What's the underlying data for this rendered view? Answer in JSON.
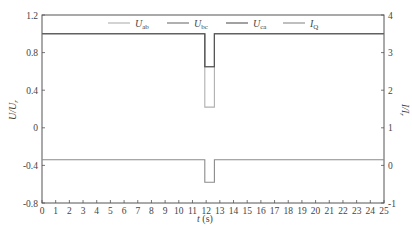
{
  "chart_data": {
    "type": "line",
    "title": "",
    "xlabel": "t (s)",
    "ylabel_left": "U/U_r",
    "ylabel_right": "I/I_r",
    "xlim": [
      0,
      25
    ],
    "ylim_left": [
      -0.8,
      1.2
    ],
    "ylim_right": [
      -1,
      4
    ],
    "grid": false,
    "legend_position": "top-inside",
    "x_ticks": [
      "0",
      "1",
      "2",
      "3",
      "4",
      "5",
      "6",
      "7",
      "8",
      "9",
      "10",
      "11",
      "12",
      "13",
      "14",
      "15",
      "16",
      "17",
      "18",
      "19",
      "20",
      "21",
      "22",
      "23",
      "24",
      "25"
    ],
    "y_ticks_left": [
      "1.2",
      "0.8",
      "0.4",
      "0",
      "-0.4",
      "-0.8"
    ],
    "y_ticks_right": [
      "4",
      "3",
      "2",
      "1",
      "0",
      "-1"
    ],
    "legend": [
      "U_ab",
      "U_bc",
      "U_ca",
      "I_Q"
    ],
    "series": [
      {
        "name": "U_ab",
        "axis": "left",
        "x": [
          0,
          11.9,
          11.9,
          12.6,
          12.6,
          25
        ],
        "values": [
          1.0,
          1.0,
          0.22,
          0.22,
          1.0,
          1.0
        ]
      },
      {
        "name": "U_bc",
        "axis": "left",
        "x": [
          0,
          11.9,
          11.9,
          12.6,
          12.6,
          25
        ],
        "values": [
          1.0,
          1.0,
          0.65,
          0.65,
          1.0,
          1.0
        ]
      },
      {
        "name": "U_ca",
        "axis": "left",
        "x": [
          0,
          11.9,
          11.9,
          12.6,
          12.6,
          25
        ],
        "values": [
          1.0,
          1.0,
          0.65,
          0.65,
          1.0,
          1.0
        ]
      },
      {
        "name": "I_Q",
        "axis": "right",
        "x": [
          0,
          11.9,
          11.9,
          12.6,
          12.6,
          25
        ],
        "values": [
          0.15,
          0.15,
          -0.45,
          -0.45,
          0.15,
          0.15
        ]
      }
    ]
  },
  "labels": {
    "xlabel_t": "t",
    "xlabel_unit": " (s)",
    "ylabel_left_main": "U/U",
    "ylabel_left_sub": "r",
    "ylabel_right_main": "I/I",
    "ylabel_right_sub": "r"
  },
  "legend_items": [
    {
      "main": "U",
      "sub": "ab"
    },
    {
      "main": "U",
      "sub": "bc"
    },
    {
      "main": "U",
      "sub": "ca"
    },
    {
      "main": "I",
      "sub": "Q"
    }
  ],
  "colors": {
    "U_ab": "#b0b0b0",
    "U_bc": "#707070",
    "U_ca": "#555555",
    "I_Q": "#8a8a8a",
    "axis": "#555555"
  }
}
